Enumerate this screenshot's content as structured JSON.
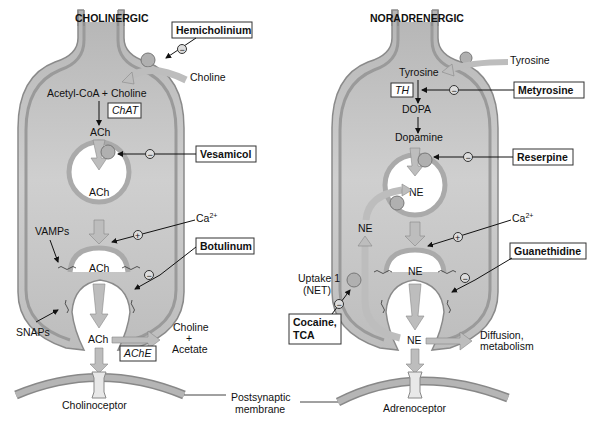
{
  "colors": {
    "cell_fill": "#c9c9c9",
    "cell_wall": "#a8a8a8",
    "cell_wall_stroke": "#7a7a7a",
    "arrow_fill": "#bdbdbd",
    "text": "#111111",
    "box_stroke": "#333333"
  },
  "cholinergic": {
    "title": "CHOLINERGIC",
    "uptake_label": "Choline",
    "synthesis_label": "Acetyl-CoA + Choline",
    "enzyme": "ChAT",
    "product": "ACh",
    "vesicle_content": "ACh",
    "vamps": "VAMPs",
    "snaps": "SNAPs",
    "released_vesicle": "ACh",
    "cleft_ach": "ACh",
    "degrading_enzyme": "AChE",
    "breakdown_line1": "Choline",
    "breakdown_plus": "+",
    "breakdown_line2": "Acetate",
    "receptor": "Cholinoceptor",
    "calcium": "Ca",
    "calcium_sup": "2+",
    "drugs": {
      "hemicholinium": "Hemicholinium",
      "vesamicol": "Vesamicol",
      "botulinum": "Botulinum"
    }
  },
  "noradrenergic": {
    "title": "NORADRENERGIC",
    "uptake_label": "Tyrosine",
    "inside_tyrosine": "Tyrosine",
    "enzyme": "TH",
    "dopa": "DOPA",
    "dopamine": "Dopamine",
    "vesicle_content": "NE",
    "reuptake_ne": "NE",
    "released_vesicle": "NE",
    "uptake1_line1": "Uptake 1",
    "uptake1_line2": "(NET)",
    "cleft_ne": "NE",
    "diffusion_line1": "Diffusion,",
    "diffusion_line2": "metabolism",
    "receptor": "Adrenoceptor",
    "calcium": "Ca",
    "calcium_sup": "2+",
    "drugs": {
      "metyrosine": "Metyrosine",
      "reserpine": "Reserpine",
      "guanethidine": "Guanethidine",
      "cocaine_line1": "Cocaine,",
      "cocaine_line2": "TCA"
    }
  },
  "shared": {
    "postsynaptic_line1": "Postsynaptic",
    "postsynaptic_line2": "membrane",
    "inhibit_symbol": "−",
    "stimulate_symbol": "+"
  }
}
